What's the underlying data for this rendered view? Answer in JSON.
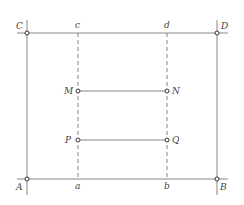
{
  "diagram": {
    "labels": {
      "A": "A",
      "B": "B",
      "C": "C",
      "D": "D",
      "a": "a",
      "b": "b",
      "c": "c",
      "d": "d",
      "M": "M",
      "N": "N",
      "P": "P",
      "Q": "Q"
    },
    "points": {
      "A": [
        27,
        179
      ],
      "B": [
        217,
        179
      ],
      "C": [
        27,
        33
      ],
      "D": [
        217,
        33
      ],
      "M": [
        78,
        91
      ],
      "N": [
        167,
        91
      ],
      "P": [
        78,
        140
      ],
      "Q": [
        167,
        140
      ]
    },
    "line_color": "#888888"
  }
}
